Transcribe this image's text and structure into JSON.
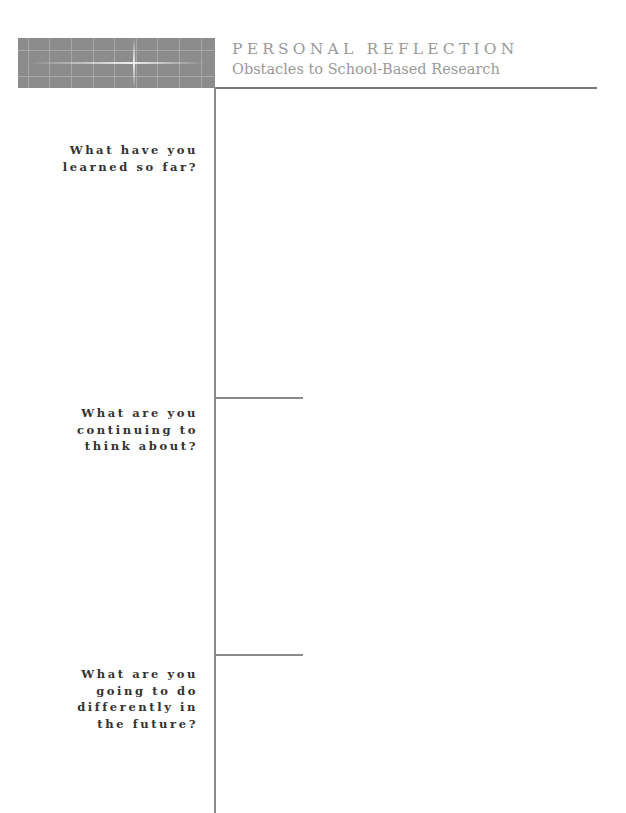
{
  "header": {
    "kicker": "PERSONAL REFLECTION",
    "subtitle": "Obstacles to School-Based Research",
    "tile_color": "#8c8c8c",
    "title_color": "#9a9a9a"
  },
  "sections": [
    {
      "prompt_lines": [
        "What have you",
        "learned so far?"
      ],
      "answer": ""
    },
    {
      "prompt_lines": [
        "What are you",
        "continuing to",
        "think about?"
      ],
      "answer": ""
    },
    {
      "prompt_lines": [
        "What are you",
        "going to do",
        "differently in",
        "the future?"
      ],
      "answer": ""
    }
  ]
}
